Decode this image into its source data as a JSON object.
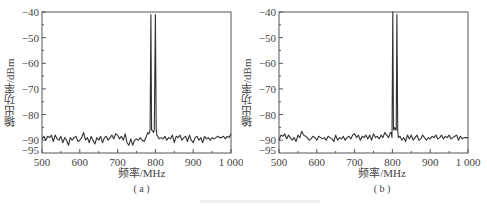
{
  "chart_data": [
    {
      "type": "line",
      "panel": "(a)",
      "xlabel": "频率/MHz",
      "ylabel": "输出功率/dBm",
      "xlim": [
        500,
        1000
      ],
      "ylim": [
        -95,
        -40
      ],
      "xticks": [
        "500",
        "600",
        "700",
        "800",
        "900",
        "1 000"
      ],
      "yticks": [
        "-40",
        "-50",
        "-60",
        "-70",
        "-80",
        "-90",
        "-95"
      ],
      "grid": false,
      "noise_floor_dbm": -89,
      "peaks": [
        {
          "freq_mhz": 788,
          "power_dbm": -41
        },
        {
          "freq_mhz": 802,
          "power_dbm": -41
        }
      ],
      "peak_valley_dbm": -86,
      "series": [
        {
          "name": "spectrum",
          "x": [
            500,
            505,
            510,
            515,
            520,
            525,
            530,
            535,
            540,
            545,
            550,
            555,
            560,
            565,
            570,
            575,
            580,
            585,
            590,
            595,
            600,
            605,
            610,
            615,
            620,
            625,
            630,
            635,
            640,
            645,
            650,
            655,
            660,
            665,
            670,
            675,
            680,
            685,
            690,
            695,
            700,
            705,
            710,
            715,
            720,
            725,
            730,
            735,
            740,
            745,
            750,
            755,
            760,
            765,
            770,
            775,
            780,
            783,
            786,
            788,
            790,
            793,
            795,
            797,
            800,
            802,
            804,
            806,
            810,
            815,
            820,
            825,
            830,
            835,
            840,
            845,
            850,
            855,
            860,
            865,
            870,
            875,
            880,
            885,
            890,
            895,
            900,
            905,
            910,
            915,
            920,
            925,
            930,
            935,
            940,
            945,
            950,
            955,
            960,
            965,
            970,
            975,
            980,
            985,
            990,
            995,
            1000
          ],
          "y": [
            -89.5,
            -88.5,
            -90,
            -88.5,
            -89,
            -88,
            -90.5,
            -88,
            -89.5,
            -90,
            -88.5,
            -91,
            -89,
            -90,
            -92,
            -89,
            -90,
            -89,
            -88.5,
            -90.5,
            -90,
            -89,
            -87,
            -90,
            -89,
            -91,
            -88.5,
            -90,
            -91.5,
            -89,
            -90,
            -88.5,
            -91,
            -89,
            -88.5,
            -90,
            -89,
            -88,
            -89.5,
            -87.5,
            -88,
            -89.5,
            -88.5,
            -90,
            -87.5,
            -91,
            -92,
            -89.5,
            -92,
            -90,
            -89.5,
            -90,
            -89,
            -90,
            -90.5,
            -89,
            -87,
            -87.5,
            -86,
            -41,
            -86,
            -86.5,
            -87,
            -86,
            -41,
            -86,
            -88,
            -88.5,
            -89.5,
            -89,
            -89.5,
            -88.5,
            -90,
            -89,
            -89.5,
            -88,
            -91,
            -88.5,
            -89,
            -88,
            -90,
            -89,
            -88.5,
            -90.5,
            -88,
            -90,
            -91,
            -89,
            -88.5,
            -90,
            -89,
            -91,
            -88.5,
            -89.5,
            -89,
            -90,
            -89,
            -89.5,
            -89,
            -88.5,
            -89,
            -89,
            -88.5,
            -89.5,
            -88.5,
            -89,
            -87.5
          ]
        }
      ]
    },
    {
      "type": "line",
      "panel": "(b)",
      "xlabel": "频率/MHz",
      "ylabel": "输出功率/dBm",
      "xlim": [
        500,
        1000
      ],
      "ylim": [
        -95,
        -40
      ],
      "xticks": [
        "500",
        "600",
        "700",
        "800",
        "900",
        "1 000"
      ],
      "yticks": [
        "-40",
        "-50",
        "-60",
        "-70",
        "-80",
        "-90",
        "-95"
      ],
      "grid": false,
      "noise_floor_dbm": -89,
      "peaks": [
        {
          "freq_mhz": 801,
          "power_dbm": -40
        },
        {
          "freq_mhz": 812,
          "power_dbm": -41
        }
      ],
      "peak_valley_dbm": -86,
      "series": [
        {
          "name": "spectrum",
          "x": [
            500,
            505,
            510,
            515,
            520,
            525,
            530,
            535,
            540,
            545,
            550,
            555,
            560,
            565,
            570,
            575,
            580,
            585,
            590,
            595,
            600,
            605,
            610,
            615,
            620,
            625,
            630,
            635,
            640,
            645,
            650,
            655,
            660,
            665,
            670,
            675,
            680,
            685,
            690,
            695,
            700,
            705,
            710,
            715,
            720,
            725,
            730,
            735,
            740,
            745,
            750,
            755,
            760,
            765,
            770,
            775,
            780,
            785,
            790,
            795,
            797,
            799,
            801,
            803,
            806,
            808,
            810,
            812,
            814,
            816,
            820,
            825,
            830,
            835,
            840,
            845,
            850,
            855,
            860,
            865,
            870,
            875,
            880,
            885,
            890,
            895,
            900,
            905,
            910,
            915,
            920,
            925,
            930,
            935,
            940,
            945,
            950,
            955,
            960,
            965,
            970,
            975,
            980,
            985,
            990,
            995,
            1000
          ],
          "y": [
            -90,
            -88,
            -88.5,
            -87.5,
            -89.5,
            -88,
            -89,
            -90,
            -89,
            -90.5,
            -88,
            -89,
            -86.5,
            -88,
            -88.5,
            -89,
            -90,
            -89.5,
            -88.5,
            -89,
            -90,
            -88.5,
            -89,
            -89.5,
            -89,
            -90,
            -88.5,
            -89,
            -89.5,
            -90.5,
            -88,
            -90,
            -89,
            -89.5,
            -88.5,
            -90,
            -89,
            -88.5,
            -89.5,
            -88,
            -87.5,
            -89,
            -88,
            -90,
            -88.5,
            -89,
            -88,
            -89.5,
            -88,
            -90,
            -87.5,
            -89,
            -88.5,
            -89.5,
            -88,
            -89,
            -87,
            -88,
            -89,
            -87,
            -87,
            -89,
            -40,
            -86,
            -85,
            -86,
            -86,
            -41,
            -86,
            -89,
            -88.5,
            -90,
            -89,
            -90.5,
            -88,
            -89.5,
            -88,
            -90,
            -89,
            -88,
            -90,
            -89.5,
            -88,
            -89,
            -90,
            -89,
            -89.5,
            -88.5,
            -89,
            -88,
            -89.5,
            -89,
            -88,
            -89.5,
            -88.5,
            -89,
            -88,
            -89.5,
            -89,
            -88.5,
            -88,
            -90,
            -88.5,
            -89.5,
            -89,
            -89,
            -89
          ]
        }
      ]
    }
  ],
  "panels": {
    "a": {
      "xlabel": "频率/MHz",
      "ylabel": "输出功率/dBm",
      "caption": "( a )",
      "xticks": [
        "500",
        "600",
        "700",
        "800",
        "900",
        "1 000"
      ],
      "yticks": [
        "-40",
        "-50",
        "-60",
        "-70",
        "-80",
        "-90",
        "-95"
      ]
    },
    "b": {
      "xlabel": "频率/MHz",
      "ylabel": "输出功率/dBm",
      "caption": "( b )",
      "xticks": [
        "500",
        "600",
        "700",
        "800",
        "900",
        "1 000"
      ],
      "yticks": [
        "-40",
        "-50",
        "-60",
        "-70",
        "-80",
        "-90",
        "-95"
      ]
    }
  },
  "colors": {
    "line": "#333333",
    "axes": "#555555",
    "text": "#444444"
  }
}
